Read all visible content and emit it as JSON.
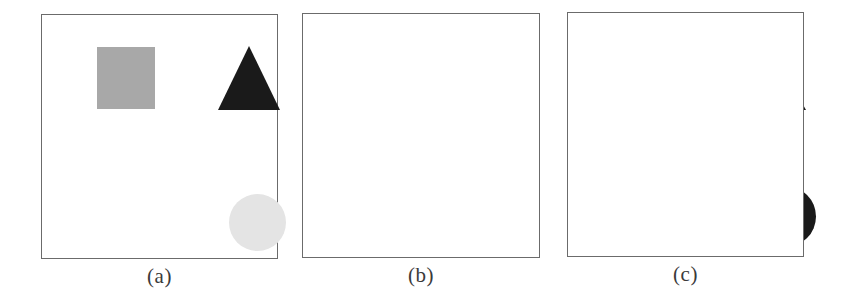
{
  "figure": {
    "name": "shape-segmentation-three-panel-figure",
    "background_color": "#ffffff",
    "width": 841,
    "height": 304
  },
  "palette": {
    "black": "#1a1a1a",
    "medium_gray": "#a8a8a8",
    "light_gray": "#e4e4e4",
    "border_gray": "#6b6b6b",
    "caption_text": "#3a3a3a"
  },
  "panels": [
    {
      "id": "a",
      "caption": "(a)",
      "frame": {
        "x": 41,
        "y": 14,
        "width": 237,
        "height": 245
      },
      "shapes": [
        {
          "name": "gray-square",
          "type": "square",
          "fill": "#a8a8a8",
          "x": 55,
          "y": 32,
          "width": 58,
          "height": 62
        },
        {
          "name": "black-triangle",
          "type": "triangle",
          "fill": "#1a1a1a",
          "x": 176,
          "y": 31,
          "width": 62,
          "height": 64
        },
        {
          "name": "light-gray-circle",
          "type": "circle",
          "fill": "#e4e4e4",
          "x": 187,
          "y": 179,
          "width": 57,
          "height": 57
        }
      ]
    },
    {
      "id": "b",
      "caption": "(b)",
      "frame": {
        "x": 302,
        "y": 13,
        "width": 238,
        "height": 245
      },
      "shapes": [
        {
          "name": "black-square",
          "type": "square",
          "fill": "#1a1a1a",
          "x": 316,
          "y": 36,
          "width": 64,
          "height": 65
        },
        {
          "name": "black-triangle",
          "type": "triangle",
          "fill": "#1a1a1a",
          "x": 437,
          "y": 37,
          "width": 66,
          "height": 59
        },
        {
          "name": "black-ellipse",
          "type": "ellipse",
          "fill": "#1a1a1a",
          "x": 322,
          "y": 136,
          "width": 135,
          "height": 45
        },
        {
          "name": "black-circle",
          "type": "circle",
          "fill": "#1a1a1a",
          "x": 452,
          "y": 172,
          "width": 61,
          "height": 61
        }
      ]
    },
    {
      "id": "c",
      "caption": "(c)",
      "frame": {
        "x": 567,
        "y": 12,
        "width": 237,
        "height": 245
      },
      "shapes": [
        {
          "name": "black-triangle",
          "type": "triangle",
          "fill": "#1a1a1a",
          "x": 700,
          "y": 32,
          "width": 66,
          "height": 65
        }
      ]
    }
  ]
}
